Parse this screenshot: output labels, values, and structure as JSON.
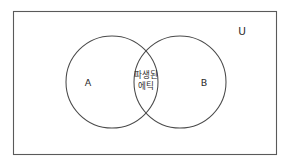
{
  "figure": {
    "type": "venn-diagram-two-set",
    "background_color": "#ffffff",
    "line_color": "#4a4a4a",
    "text_color": "#2b2b2b"
  },
  "universe": {
    "label": "U"
  },
  "sets": [
    {
      "id": "A",
      "label": "A"
    },
    {
      "id": "B",
      "label": "B"
    }
  ],
  "intersection": {
    "label_line1": "파생된",
    "label_line2": "에틱",
    "label_full": "파생된 에틱"
  }
}
